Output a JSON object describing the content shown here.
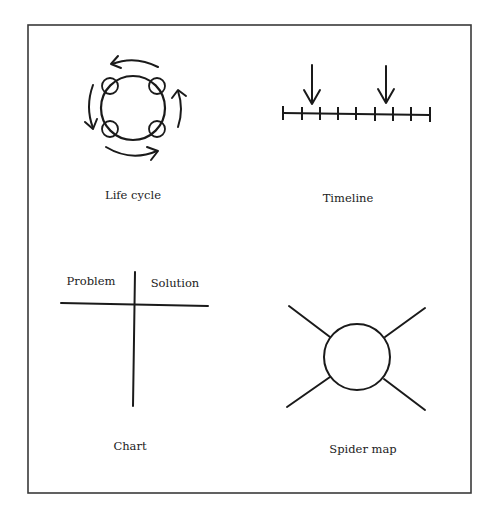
{
  "diagram": {
    "panels": [
      {
        "id": "life-cycle",
        "label": "Life cycle"
      },
      {
        "id": "timeline",
        "label": "Timeline"
      },
      {
        "id": "chart",
        "label": "Chart",
        "columns": [
          "Problem",
          "Solution"
        ]
      },
      {
        "id": "spider-map",
        "label": "Spider map"
      }
    ],
    "colors": {
      "ink": "#1a1a1a",
      "background": "#ffffff"
    }
  }
}
